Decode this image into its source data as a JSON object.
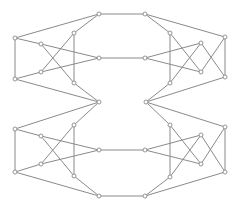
{
  "diagram": {
    "type": "graph",
    "colors": {
      "edge": "#8a8a8a",
      "node_fill": "#ffffff",
      "node_stroke": "#8a8a8a",
      "background": "#ffffff"
    },
    "node_radius": 2,
    "nodes": [
      {
        "id": "n0",
        "x": 99,
        "y": 14
      },
      {
        "id": "n1",
        "x": 145,
        "y": 14
      },
      {
        "id": "n2",
        "x": 15,
        "y": 38
      },
      {
        "id": "n3",
        "x": 15,
        "y": 79
      },
      {
        "id": "n4",
        "x": 41,
        "y": 44
      },
      {
        "id": "n5",
        "x": 41,
        "y": 72
      },
      {
        "id": "n6",
        "x": 74,
        "y": 33
      },
      {
        "id": "n7",
        "x": 74,
        "y": 83
      },
      {
        "id": "n8",
        "x": 99,
        "y": 58
      },
      {
        "id": "n9",
        "x": 145,
        "y": 58
      },
      {
        "id": "n10",
        "x": 99,
        "y": 102
      },
      {
        "id": "n11",
        "x": 146,
        "y": 102
      },
      {
        "id": "n12",
        "x": 225,
        "y": 37
      },
      {
        "id": "n13",
        "x": 225,
        "y": 77
      },
      {
        "id": "n14",
        "x": 201,
        "y": 43
      },
      {
        "id": "n15",
        "x": 201,
        "y": 72
      },
      {
        "id": "n16",
        "x": 170,
        "y": 33
      },
      {
        "id": "n17",
        "x": 170,
        "y": 83
      },
      {
        "id": "n18",
        "x": 15,
        "y": 129
      },
      {
        "id": "n19",
        "x": 15,
        "y": 172
      },
      {
        "id": "n20",
        "x": 41,
        "y": 136
      },
      {
        "id": "n21",
        "x": 41,
        "y": 164
      },
      {
        "id": "n22",
        "x": 74,
        "y": 125
      },
      {
        "id": "n23",
        "x": 74,
        "y": 176
      },
      {
        "id": "n24",
        "x": 99,
        "y": 150
      },
      {
        "id": "n25",
        "x": 145,
        "y": 150
      },
      {
        "id": "n26",
        "x": 99,
        "y": 196
      },
      {
        "id": "n27",
        "x": 145,
        "y": 196
      },
      {
        "id": "n28",
        "x": 225,
        "y": 127
      },
      {
        "id": "n29",
        "x": 225,
        "y": 172
      },
      {
        "id": "n30",
        "x": 201,
        "y": 135
      },
      {
        "id": "n31",
        "x": 201,
        "y": 164
      },
      {
        "id": "n32",
        "x": 170,
        "y": 125
      },
      {
        "id": "n33",
        "x": 170,
        "y": 177
      }
    ],
    "edges": [
      [
        "n0",
        "n1"
      ],
      [
        "n8",
        "n9"
      ],
      [
        "n24",
        "n25"
      ],
      [
        "n26",
        "n27"
      ],
      [
        "n2",
        "n0"
      ],
      [
        "n2",
        "n3"
      ],
      [
        "n2",
        "n4"
      ],
      [
        "n4",
        "n8"
      ],
      [
        "n3",
        "n5"
      ],
      [
        "n5",
        "n8"
      ],
      [
        "n3",
        "n10"
      ],
      [
        "n0",
        "n6"
      ],
      [
        "n6",
        "n5"
      ],
      [
        "n4",
        "n7"
      ],
      [
        "n7",
        "n10"
      ],
      [
        "n6",
        "n7"
      ],
      [
        "n12",
        "n1"
      ],
      [
        "n12",
        "n13"
      ],
      [
        "n12",
        "n15"
      ],
      [
        "n15",
        "n9"
      ],
      [
        "n13",
        "n14"
      ],
      [
        "n14",
        "n9"
      ],
      [
        "n13",
        "n11"
      ],
      [
        "n1",
        "n16"
      ],
      [
        "n16",
        "n17"
      ],
      [
        "n14",
        "n17"
      ],
      [
        "n16",
        "n15"
      ],
      [
        "n17",
        "n11"
      ],
      [
        "n18",
        "n10"
      ],
      [
        "n18",
        "n19"
      ],
      [
        "n18",
        "n20"
      ],
      [
        "n20",
        "n24"
      ],
      [
        "n19",
        "n21"
      ],
      [
        "n21",
        "n24"
      ],
      [
        "n19",
        "n26"
      ],
      [
        "n10",
        "n22"
      ],
      [
        "n22",
        "n21"
      ],
      [
        "n20",
        "n23"
      ],
      [
        "n23",
        "n26"
      ],
      [
        "n22",
        "n23"
      ],
      [
        "n28",
        "n11"
      ],
      [
        "n28",
        "n29"
      ],
      [
        "n28",
        "n31"
      ],
      [
        "n31",
        "n25"
      ],
      [
        "n29",
        "n30"
      ],
      [
        "n30",
        "n25"
      ],
      [
        "n29",
        "n27"
      ],
      [
        "n11",
        "n32"
      ],
      [
        "n32",
        "n33"
      ],
      [
        "n30",
        "n33"
      ],
      [
        "n32",
        "n31"
      ],
      [
        "n33",
        "n27"
      ]
    ]
  }
}
